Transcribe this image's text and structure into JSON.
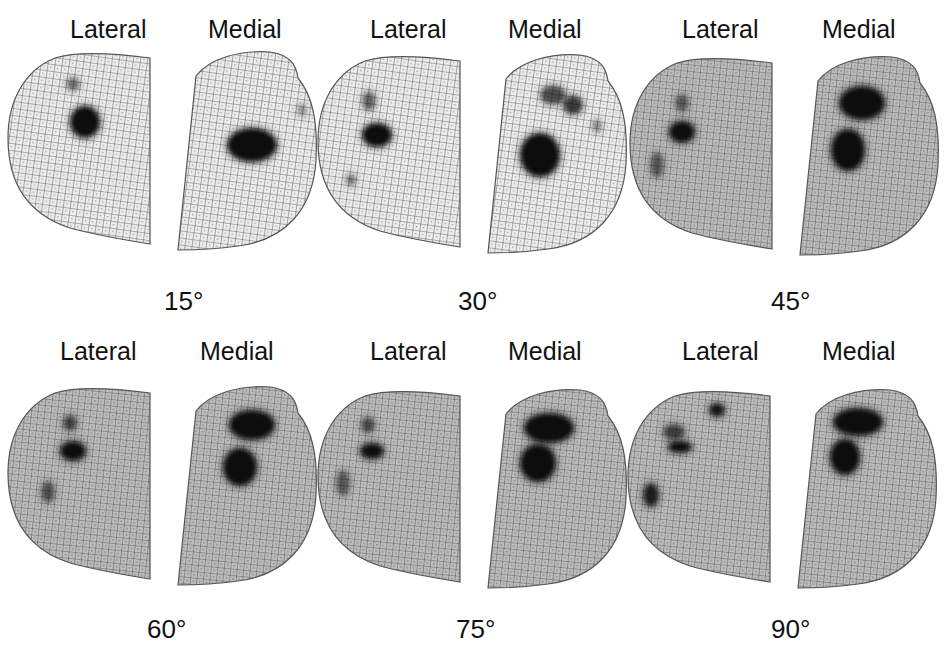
{
  "figure": {
    "background": "#ffffff",
    "mesh_light_fill": "#e9e9e9",
    "mesh_dark_fill": "#b9b9b9",
    "mesh_line": "#3a3a3a",
    "contact_color": "#0a0a0a",
    "panels": [
      {
        "angle": "15°",
        "lateral_label": "Lateral",
        "medial_label": "Medial",
        "origin": [
          0,
          0
        ],
        "shade": "light",
        "lateral_contacts": [
          {
            "cx": 85,
            "cy": 122,
            "rx": 14,
            "ry": 15,
            "o": 1.0
          },
          {
            "cx": 73,
            "cy": 84,
            "rx": 6,
            "ry": 6,
            "o": 0.45
          }
        ],
        "medial_contacts": [
          {
            "cx": 252,
            "cy": 145,
            "rx": 24,
            "ry": 16,
            "o": 1.0
          },
          {
            "cx": 302,
            "cy": 110,
            "rx": 4,
            "ry": 6,
            "o": 0.3
          }
        ]
      },
      {
        "angle": "30°",
        "lateral_label": "Lateral",
        "medial_label": "Medial",
        "origin": [
          320,
          0
        ],
        "shade": "light",
        "lateral_contacts": [
          {
            "cx": 387,
            "cy": 135,
            "rx": 14,
            "ry": 11,
            "o": 1.0
          },
          {
            "cx": 379,
            "cy": 101,
            "rx": 6,
            "ry": 9,
            "o": 0.5
          },
          {
            "cx": 361,
            "cy": 180,
            "rx": 4,
            "ry": 5,
            "o": 0.45
          }
        ],
        "medial_contacts": [
          {
            "cx": 550,
            "cy": 155,
            "rx": 19,
            "ry": 21,
            "o": 1.0
          },
          {
            "cx": 563,
            "cy": 95,
            "rx": 12,
            "ry": 9,
            "o": 0.6
          },
          {
            "cx": 583,
            "cy": 105,
            "rx": 9,
            "ry": 9,
            "o": 0.7
          },
          {
            "cx": 607,
            "cy": 126,
            "rx": 4,
            "ry": 6,
            "o": 0.35
          }
        ]
      },
      {
        "angle": "45°",
        "lateral_label": "Lateral",
        "medial_label": "Medial",
        "origin": [
          632,
          0
        ],
        "shade": "dark",
        "lateral_contacts": [
          {
            "cx": 692,
            "cy": 132,
            "rx": 12,
            "ry": 10,
            "o": 1.0
          },
          {
            "cx": 692,
            "cy": 103,
            "rx": 6,
            "ry": 8,
            "o": 0.45
          },
          {
            "cx": 667,
            "cy": 165,
            "rx": 6,
            "ry": 12,
            "o": 0.45
          }
        ],
        "medial_contacts": [
          {
            "cx": 872,
            "cy": 103,
            "rx": 22,
            "ry": 16,
            "o": 1.0
          },
          {
            "cx": 858,
            "cy": 150,
            "rx": 16,
            "ry": 20,
            "o": 1.0
          }
        ]
      },
      {
        "angle": "60°",
        "lateral_label": "Lateral",
        "medial_label": "Medial",
        "origin": [
          0,
          320
        ],
        "shade": "dark",
        "lateral_contacts": [
          {
            "cx": 73,
            "cy": 451,
            "rx": 12,
            "ry": 9,
            "o": 1.0
          },
          {
            "cx": 70,
            "cy": 423,
            "rx": 6,
            "ry": 7,
            "o": 0.6
          },
          {
            "cx": 48,
            "cy": 492,
            "rx": 6,
            "ry": 10,
            "o": 0.5
          }
        ],
        "medial_contacts": [
          {
            "cx": 252,
            "cy": 425,
            "rx": 22,
            "ry": 14,
            "o": 1.0
          },
          {
            "cx": 240,
            "cy": 467,
            "rx": 16,
            "ry": 18,
            "o": 1.0
          }
        ]
      },
      {
        "angle": "75°",
        "lateral_label": "Lateral",
        "medial_label": "Medial",
        "origin": [
          320,
          320
        ],
        "shade": "dark",
        "lateral_contacts": [
          {
            "cx": 382,
            "cy": 451,
            "rx": 11,
            "ry": 7,
            "o": 1.0
          },
          {
            "cx": 378,
            "cy": 425,
            "rx": 6,
            "ry": 7,
            "o": 0.55
          },
          {
            "cx": 353,
            "cy": 483,
            "rx": 6,
            "ry": 12,
            "o": 0.45
          }
        ],
        "medial_contacts": [
          {
            "cx": 559,
            "cy": 428,
            "rx": 24,
            "ry": 14,
            "o": 1.0
          },
          {
            "cx": 548,
            "cy": 463,
            "rx": 17,
            "ry": 18,
            "o": 1.0
          }
        ]
      },
      {
        "angle": "90°",
        "lateral_label": "Lateral",
        "medial_label": "Medial",
        "origin": [
          632,
          320
        ],
        "shade": "dark",
        "lateral_contacts": [
          {
            "cx": 692,
            "cy": 447,
            "rx": 11,
            "ry": 5,
            "o": 1.0
          },
          {
            "cx": 686,
            "cy": 432,
            "rx": 10,
            "ry": 7,
            "o": 0.6
          },
          {
            "cx": 729,
            "cy": 410,
            "rx": 7,
            "ry": 6,
            "o": 0.9
          },
          {
            "cx": 663,
            "cy": 495,
            "rx": 7,
            "ry": 11,
            "o": 0.85
          }
        ],
        "medial_contacts": [
          {
            "cx": 870,
            "cy": 422,
            "rx": 24,
            "ry": 13,
            "o": 1.0
          },
          {
            "cx": 857,
            "cy": 457,
            "rx": 14,
            "ry": 17,
            "o": 1.0
          }
        ]
      }
    ]
  }
}
